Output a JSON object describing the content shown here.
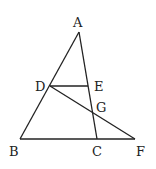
{
  "diagram": {
    "type": "geometry",
    "points": {
      "A": {
        "label": "A",
        "x": 79,
        "y": 32
      },
      "B": {
        "label": "B",
        "x": 20,
        "y": 139
      },
      "C": {
        "label": "C",
        "x": 97,
        "y": 139
      },
      "F": {
        "label": "F",
        "x": 135,
        "y": 139
      },
      "D": {
        "label": "D",
        "x": 50,
        "y": 86
      },
      "E": {
        "label": "E",
        "x": 88,
        "y": 86
      },
      "G": {
        "label": "G",
        "x": 92,
        "y": 112
      }
    },
    "segments": [
      "AB",
      "AC",
      "BF",
      "DE",
      "DF"
    ],
    "stroke_color": "#222222"
  }
}
